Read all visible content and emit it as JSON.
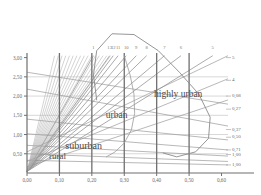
{
  "chart_data": {
    "type": "line",
    "title": "",
    "xlabel": "",
    "ylabel": "",
    "xlim": [
      0.0,
      0.62
    ],
    "ylim": [
      0.0,
      3.12
    ],
    "grid": true,
    "legend_position": "none",
    "x_ticks": [
      "0,00",
      "0,10",
      "0,20",
      "0,30",
      "0,40",
      "0,50",
      "0,60"
    ],
    "x_tick_values": [
      0.0,
      0.1,
      0.2,
      0.3,
      0.4,
      0.5,
      0.6
    ],
    "y_ticks": [
      "0,50",
      "1,00",
      "1,50",
      "2,00",
      "2,50",
      "3,00"
    ],
    "y_tick_values": [
      0.5,
      1.0,
      1.5,
      2.0,
      2.5,
      3.0
    ],
    "top_labels": [
      "1",
      "13",
      "12",
      "11",
      "10",
      "9",
      "8",
      "7",
      "6",
      "5"
    ],
    "top_label_x": [
      0.205,
      0.255,
      0.266,
      0.281,
      0.306,
      0.337,
      0.369,
      0.424,
      0.475,
      0.573
    ],
    "right_labels": [
      "5",
      "4",
      "0,08",
      "0,27",
      "0,37",
      "0,50",
      "0,71",
      "1,00",
      "1,00"
    ],
    "right_label_values": [
      null,
      null,
      0.08,
      0.27,
      0.37,
      0.5,
      0.71,
      1.0,
      1.0
    ],
    "right_label_y": [
      3.0,
      2.41,
      2.0,
      1.66,
      1.13,
      0.93,
      0.6,
      0.48,
      0.21
    ],
    "zones": [
      {
        "label": "rural",
        "x": 0.068,
        "y": 0.42
      },
      {
        "label": "suburban",
        "x": 0.118,
        "y": 0.69
      },
      {
        "label": "urban",
        "x": 0.243,
        "y": 1.47
      },
      {
        "label": "highly urban",
        "x": 0.392,
        "y": 2.02
      }
    ],
    "fan_origin": {
      "x": 0.0,
      "y": 0.04
    },
    "fan_rays": [
      {
        "name": "1",
        "x_end": 0.205,
        "y_end": 3.05
      },
      {
        "name": "13",
        "x_end": 0.255,
        "y_end": 3.05
      },
      {
        "name": "12",
        "x_end": 0.266,
        "y_end": 3.05
      },
      {
        "name": "11",
        "x_end": 0.281,
        "y_end": 3.05
      },
      {
        "name": "10",
        "x_end": 0.306,
        "y_end": 3.05
      },
      {
        "name": "9",
        "x_end": 0.337,
        "y_end": 3.05
      },
      {
        "name": "8",
        "x_end": 0.369,
        "y_end": 3.05
      },
      {
        "name": "7",
        "x_end": 0.424,
        "y_end": 3.05
      },
      {
        "name": "6",
        "x_end": 0.475,
        "y_end": 3.05
      },
      {
        "name": "5",
        "x_end": 0.573,
        "y_end": 3.05
      }
    ],
    "vertical_gridlines": [
      0.1,
      0.2,
      0.3,
      0.4,
      0.5
    ],
    "horizontal_gridlines": [
      0.5,
      1.0,
      1.5,
      2.0,
      2.5
    ],
    "descending_lines": [
      {
        "name": "d1",
        "x0": 0.0,
        "y0": 2.62,
        "x1": 0.62,
        "y1": 1.79
      },
      {
        "name": "d2",
        "x0": 0.0,
        "y0": 2.18,
        "x1": 0.62,
        "y1": 1.22
      },
      {
        "name": "d3",
        "x0": 0.0,
        "y0": 1.4,
        "x1": 0.62,
        "y1": 0.86
      },
      {
        "name": "d4",
        "x0": 0.0,
        "y0": 1.02,
        "x1": 0.62,
        "y1": 0.6
      },
      {
        "name": "d5",
        "x0": 0.0,
        "y0": 0.72,
        "x1": 0.62,
        "y1": 0.44
      },
      {
        "name": "d6",
        "x0": 0.0,
        "y0": 0.5,
        "x1": 0.62,
        "y1": 0.3
      },
      {
        "name": "d7",
        "x0": 0.0,
        "y0": 0.33,
        "x1": 0.62,
        "y1": 0.21
      }
    ],
    "ascending_lines": [
      {
        "name": "a1",
        "x0": 0.0,
        "y0": 0.55,
        "x1": 0.62,
        "y1": 3.05
      },
      {
        "name": "a2",
        "x0": 0.0,
        "y0": 0.3,
        "x1": 0.62,
        "y1": 2.45
      },
      {
        "name": "a3",
        "x0": 0.0,
        "y0": 0.16,
        "x1": 0.62,
        "y1": 1.9
      }
    ],
    "arc_curve": {
      "name": "top-arc",
      "points": [
        [
          0.215,
          1.9
        ],
        [
          0.205,
          2.55
        ],
        [
          0.215,
          3.18
        ],
        [
          0.262,
          3.62
        ],
        [
          0.33,
          3.6
        ],
        [
          0.405,
          3.18
        ],
        [
          0.47,
          2.62
        ],
        [
          0.53,
          2.05
        ],
        [
          0.565,
          1.45
        ],
        [
          0.56,
          0.9
        ],
        [
          0.52,
          0.55
        ],
        [
          0.462,
          0.42
        ],
        [
          0.42,
          0.52
        ]
      ]
    },
    "inner_curve": {
      "name": "inner-loop",
      "points": [
        [
          0.3,
          3.05
        ],
        [
          0.318,
          2.55
        ],
        [
          0.33,
          2.05
        ],
        [
          0.332,
          1.55
        ],
        [
          0.322,
          1.12
        ],
        [
          0.3,
          0.78
        ],
        [
          0.272,
          0.55
        ],
        [
          0.245,
          0.42
        ]
      ]
    }
  }
}
